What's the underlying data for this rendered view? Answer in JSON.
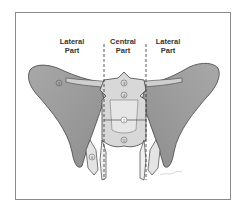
{
  "figure": {
    "regions": [
      {
        "label_line1": "Lateral",
        "label_line2": "Part"
      },
      {
        "label_line1": "Central",
        "label_line2": "Part"
      },
      {
        "label_line1": "Lateral",
        "label_line2": "Part"
      }
    ],
    "markers": [
      "1",
      "3",
      "4",
      "2",
      "5",
      "6"
    ],
    "colors": {
      "frame": "#8a8a8a",
      "bone_dark": "#9a9a9a",
      "bone_light": "#d6d6d6",
      "outline": "#444444",
      "divider": "#333333"
    }
  }
}
